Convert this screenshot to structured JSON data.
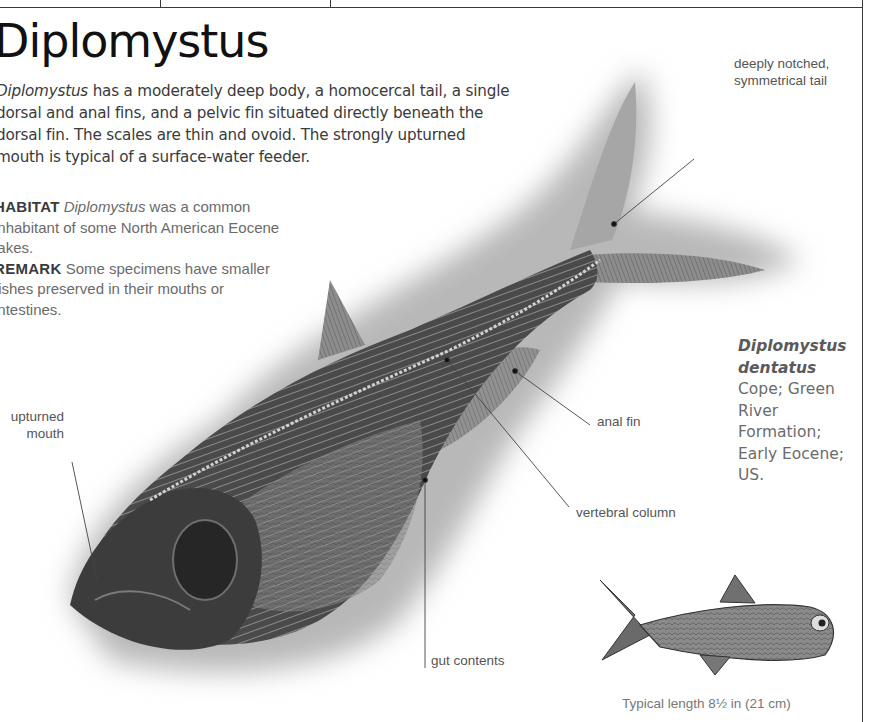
{
  "page": {
    "title": "Diplomystus",
    "intro": {
      "genus_italic": "Diplomystus",
      "text": " has a moderately deep body, a homocercal tail, a single dorsal and anal fins, and a pelvic fin situated directly beneath the dorsal fin. The scales are thin and ovoid. The strongly upturned mouth is typical of a surface-water feeder."
    },
    "notes": [
      {
        "keyword": "HABITAT",
        "italic": "Diplomystus",
        "text": " was a common inhabitant of some North American Eocene lakes."
      },
      {
        "keyword": "REMARK",
        "italic": "",
        "text": "Some specimens have smaller fishes preserved in their mouths or intestines."
      }
    ],
    "callouts": {
      "tail": "deeply notched, symmetrical tail",
      "mouth": "upturned mouth",
      "anal_fin": "anal fin",
      "vertebral_column": "vertebral column",
      "gut_contents": "gut contents"
    },
    "specimen": {
      "species_bold_italic": "Diplomystus dentatus",
      "text": " Cope; Green River Formation; Early Eocene; US."
    },
    "reconstruction_caption": "Typical length 8½ in (21 cm)"
  },
  "colors": {
    "text_dark": "#111111",
    "text_body": "#3a3a3a",
    "text_light": "#6b6b6b",
    "matrix_gray": "#b5b5b5",
    "fossil_dark": "#3c3c3c",
    "rule": "#3a3a3a"
  }
}
